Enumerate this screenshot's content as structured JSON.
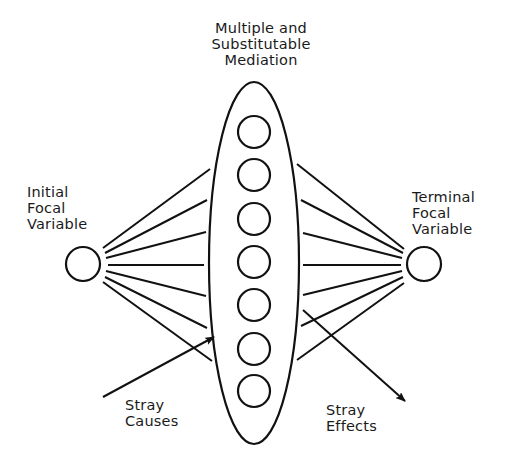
{
  "diagram": {
    "title_lines": [
      "Multiple and",
      "Substitutable",
      "Mediation"
    ],
    "initial": {
      "lines": [
        "Initial",
        "Focal",
        "Variable"
      ]
    },
    "terminal": {
      "lines": [
        "Terminal",
        "Focal",
        "Variable"
      ]
    },
    "stray_causes": {
      "lines": [
        "Stray",
        "Causes"
      ]
    },
    "stray_effects": {
      "lines": [
        "Stray",
        "Effects"
      ]
    },
    "mediator_count": 7,
    "stroke_color": "#111111",
    "background_color": "#ffffff"
  }
}
